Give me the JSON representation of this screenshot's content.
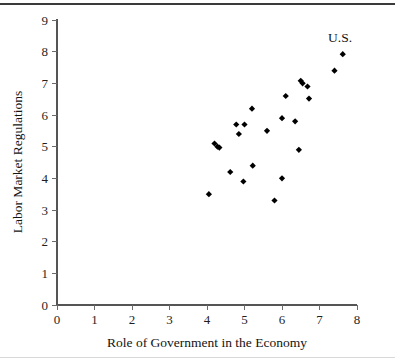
{
  "chart_data": {
    "type": "scatter",
    "title": "",
    "xlabel": "Role of Government in the Economy",
    "ylabel": "Labor Market Regulations",
    "xlim": [
      0,
      8
    ],
    "ylim": [
      0,
      9
    ],
    "xticks": [
      0,
      1,
      2,
      3,
      4,
      5,
      6,
      7,
      8
    ],
    "yticks": [
      0,
      1,
      2,
      3,
      4,
      5,
      6,
      7,
      8,
      9
    ],
    "xtick_labels": [
      "0",
      "1",
      "2",
      "3",
      "4",
      "5",
      "6",
      "7",
      "8"
    ],
    "ytick_labels": [
      "0",
      "1",
      "2",
      "3",
      "4",
      "5",
      "6",
      "7",
      "8",
      "9"
    ],
    "grid": false,
    "legend": false,
    "marker": "diamond",
    "marker_color": "#000000",
    "points": [
      {
        "x": 4.05,
        "y": 3.5
      },
      {
        "x": 4.2,
        "y": 5.1
      },
      {
        "x": 4.28,
        "y": 5.0
      },
      {
        "x": 4.33,
        "y": 4.97
      },
      {
        "x": 4.62,
        "y": 4.2
      },
      {
        "x": 4.78,
        "y": 5.7
      },
      {
        "x": 4.85,
        "y": 5.4
      },
      {
        "x": 4.97,
        "y": 3.9
      },
      {
        "x": 5.0,
        "y": 5.7
      },
      {
        "x": 5.2,
        "y": 6.2
      },
      {
        "x": 5.22,
        "y": 4.4
      },
      {
        "x": 5.6,
        "y": 5.5
      },
      {
        "x": 5.8,
        "y": 3.3
      },
      {
        "x": 6.0,
        "y": 4.0
      },
      {
        "x": 6.0,
        "y": 5.9
      },
      {
        "x": 6.1,
        "y": 6.6
      },
      {
        "x": 6.35,
        "y": 5.8
      },
      {
        "x": 6.45,
        "y": 4.9
      },
      {
        "x": 6.5,
        "y": 7.08
      },
      {
        "x": 6.55,
        "y": 7.0
      },
      {
        "x": 6.68,
        "y": 6.9
      },
      {
        "x": 6.72,
        "y": 6.52
      },
      {
        "x": 7.4,
        "y": 7.4
      },
      {
        "x": 7.62,
        "y": 7.92
      }
    ],
    "annotations": [
      {
        "text": "U.S.",
        "x": 7.55,
        "y": 8.3,
        "points_to": {
          "x": 7.62,
          "y": 7.92
        }
      }
    ]
  },
  "axis": {
    "x_title": "Role of Government in the Economy",
    "y_title": "Labor Market Regulations"
  }
}
